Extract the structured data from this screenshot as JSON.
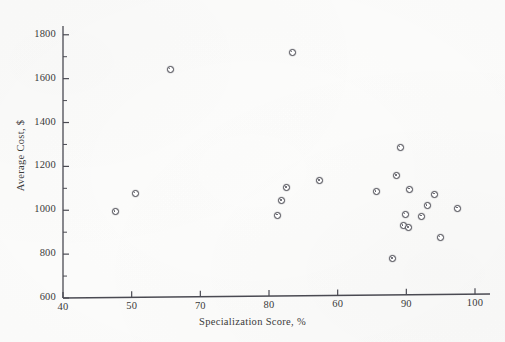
{
  "chart_data": {
    "type": "scatter",
    "title": "",
    "xlabel": "Specialization Score, %",
    "ylabel": "Average Cost, $",
    "xlim": [
      40,
      102
    ],
    "ylim": [
      600,
      1840
    ],
    "xticks": [
      40,
      50,
      70,
      80,
      60,
      90,
      100
    ],
    "xtick_labels": [
      "40",
      "50",
      "70",
      "80",
      "60",
      "90",
      "100"
    ],
    "yticks": [
      600,
      800,
      1000,
      1200,
      1400,
      1600,
      1800
    ],
    "ytick_labels": [
      "600",
      "800",
      "1000",
      "1200",
      "1400",
      "1600",
      "1800"
    ],
    "y_minor_ticks": [
      700,
      900,
      1100,
      1300,
      1500,
      1700
    ],
    "grid": false,
    "legend": null,
    "marker_style": "open-circle",
    "marker_color": "#4a4a52",
    "axis_color": "#4a4a52",
    "points": [
      {
        "x": 47.5,
        "y": 995
      },
      {
        "x": 50.4,
        "y": 1080
      },
      {
        "x": 55.5,
        "y": 1645
      },
      {
        "x": 71.1,
        "y": 980
      },
      {
        "x": 71.7,
        "y": 1047
      },
      {
        "x": 72.4,
        "y": 1105
      },
      {
        "x": 73.2,
        "y": 1722
      },
      {
        "x": 77.2,
        "y": 1138
      },
      {
        "x": 85.4,
        "y": 1088
      },
      {
        "x": 87.8,
        "y": 782
      },
      {
        "x": 88.4,
        "y": 1160
      },
      {
        "x": 88.9,
        "y": 1290
      },
      {
        "x": 89.3,
        "y": 932
      },
      {
        "x": 89.6,
        "y": 985
      },
      {
        "x": 90.1,
        "y": 922
      },
      {
        "x": 90.3,
        "y": 1098
      },
      {
        "x": 92.0,
        "y": 975
      },
      {
        "x": 92.8,
        "y": 1022
      },
      {
        "x": 93.9,
        "y": 1075
      },
      {
        "x": 94.7,
        "y": 880
      },
      {
        "x": 97.2,
        "y": 1012
      }
    ]
  },
  "axis": {
    "x_title": "Specialization Score, %",
    "y_title": "Average Cost, $"
  }
}
